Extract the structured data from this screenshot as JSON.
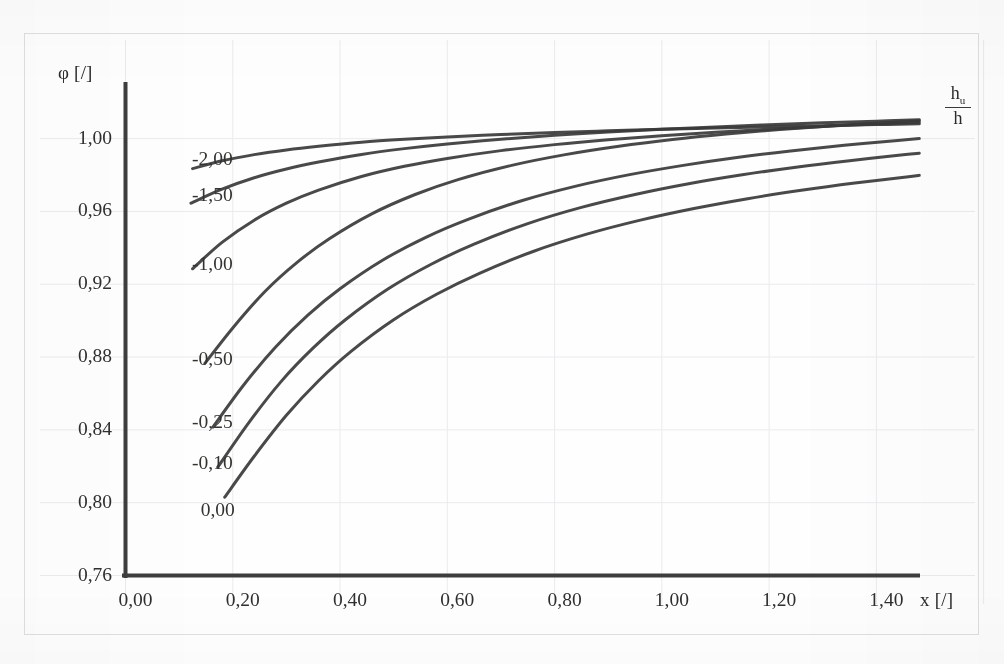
{
  "chart_data": {
    "type": "line",
    "title": "",
    "xlabel": "x [/]",
    "ylabel": "φ [/]",
    "legend_title": "h_u / h",
    "legend_title_numerator": "h",
    "legend_title_numerator_sub": "u",
    "legend_title_denominator": "h",
    "grid": true,
    "legend_position": "inline-left-of-curves",
    "xlim": [
      0.0,
      1.5
    ],
    "ylim": [
      0.76,
      1.03
    ],
    "x_ticks": [
      "0,00",
      "0,20",
      "0,40",
      "0,60",
      "0,80",
      "1,00",
      "1,20",
      "1,40"
    ],
    "x_tick_values": [
      0.0,
      0.2,
      0.4,
      0.6,
      0.8,
      1.0,
      1.2,
      1.4
    ],
    "y_ticks": [
      "0,76",
      "0,80",
      "0,84",
      "0,88",
      "0,92",
      "0,96",
      "1,00"
    ],
    "y_tick_values": [
      0.76,
      0.8,
      0.84,
      0.88,
      0.92,
      0.96,
      1.0
    ],
    "series": [
      {
        "name": "-2,00",
        "label": "-2,00",
        "label_x": 0.088,
        "label_y": 0.9885,
        "x": [
          0.125,
          0.18,
          0.24,
          0.3,
          0.36,
          0.44,
          0.52,
          0.6,
          0.7,
          0.8,
          0.9,
          1.0,
          1.1,
          1.2,
          1.3,
          1.4,
          1.48
        ],
        "y": [
          0.9835,
          0.9878,
          0.9912,
          0.9938,
          0.9958,
          0.998,
          0.9996,
          1.0009,
          1.0022,
          1.0033,
          1.0043,
          1.0051,
          1.0058,
          1.0065,
          1.0071,
          1.0077,
          1.0081
        ]
      },
      {
        "name": "-1,50",
        "label": "-1,50",
        "label_x": 0.088,
        "label_y": 0.9685,
        "x": [
          0.122,
          0.18,
          0.24,
          0.3,
          0.36,
          0.44,
          0.52,
          0.6,
          0.7,
          0.8,
          0.9,
          1.0,
          1.1,
          1.2,
          1.3,
          1.4,
          1.48
        ],
        "y": [
          0.9645,
          0.9722,
          0.9785,
          0.9833,
          0.9871,
          0.9913,
          0.9945,
          0.9971,
          0.9997,
          1.0018,
          1.0036,
          1.0051,
          1.0064,
          1.0076,
          1.0087,
          1.0096,
          1.0103
        ]
      },
      {
        "name": "-1,00",
        "label": "-1,00",
        "label_x": 0.088,
        "label_y": 0.9305,
        "x": [
          0.125,
          0.18,
          0.24,
          0.3,
          0.36,
          0.44,
          0.52,
          0.6,
          0.7,
          0.8,
          0.9,
          1.0,
          1.1,
          1.2,
          1.3,
          1.4,
          1.48
        ],
        "y": [
          0.9285,
          0.943,
          0.9552,
          0.9645,
          0.9717,
          0.9792,
          0.9848,
          0.9891,
          0.9934,
          0.9967,
          0.9994,
          1.0016,
          1.0035,
          1.0052,
          1.0067,
          1.008,
          1.009
        ]
      },
      {
        "name": "-0,50",
        "label": "-0,50",
        "label_x": 0.088,
        "label_y": 0.8785,
        "x": [
          0.148,
          0.2,
          0.26,
          0.32,
          0.38,
          0.46,
          0.54,
          0.62,
          0.72,
          0.82,
          0.92,
          1.02,
          1.12,
          1.22,
          1.32,
          1.42,
          1.48
        ],
        "y": [
          0.8765,
          0.896,
          0.916,
          0.932,
          0.945,
          0.9588,
          0.9693,
          0.9775,
          0.9853,
          0.9912,
          0.9958,
          0.9995,
          1.0025,
          1.005,
          1.0071,
          1.0089,
          1.0098
        ]
      },
      {
        "name": "-0,25",
        "label": "-0,25",
        "label_x": 0.088,
        "label_y": 0.8435,
        "x": [
          0.163,
          0.22,
          0.28,
          0.34,
          0.4,
          0.48,
          0.56,
          0.64,
          0.74,
          0.84,
          0.94,
          1.04,
          1.14,
          1.24,
          1.34,
          1.44,
          1.48
        ],
        "y": [
          0.8415,
          0.8645,
          0.8855,
          0.903,
          0.9175,
          0.9333,
          0.9458,
          0.9558,
          0.966,
          0.9739,
          0.9802,
          0.9853,
          0.9896,
          0.9932,
          0.9963,
          0.999,
          1.0
        ]
      },
      {
        "name": "-0,10",
        "label": "-0,10",
        "label_x": 0.088,
        "label_y": 0.8215,
        "x": [
          0.172,
          0.23,
          0.29,
          0.35,
          0.41,
          0.49,
          0.57,
          0.65,
          0.75,
          0.85,
          0.95,
          1.05,
          1.15,
          1.25,
          1.35,
          1.45,
          1.48
        ],
        "y": [
          0.8195,
          0.844,
          0.8665,
          0.885,
          0.9005,
          0.9175,
          0.931,
          0.942,
          0.9533,
          0.9622,
          0.9693,
          0.9752,
          0.9801,
          0.9843,
          0.9879,
          0.9911,
          0.992
        ]
      },
      {
        "name": "0,00",
        "label": "0,00",
        "label_x": 0.092,
        "label_y": 0.7955,
        "x": [
          0.185,
          0.24,
          0.3,
          0.36,
          0.42,
          0.5,
          0.58,
          0.66,
          0.76,
          0.86,
          0.96,
          1.06,
          1.16,
          1.26,
          1.36,
          1.46,
          1.48
        ],
        "y": [
          0.803,
          0.8255,
          0.848,
          0.867,
          0.883,
          0.9005,
          0.9145,
          0.926,
          0.938,
          0.9475,
          0.9552,
          0.9616,
          0.967,
          0.9716,
          0.9756,
          0.9791,
          0.9798
        ]
      }
    ]
  },
  "axes": {
    "y_axis_title": "φ [/]",
    "x_axis_title": "x [/]"
  },
  "style": {
    "curve_color": "#3a3a3a",
    "axis_color": "#3d3d3d",
    "grid_color": "#ebebee",
    "frame_color": "#dfe0e2",
    "text_color": "#2f2f2f"
  }
}
